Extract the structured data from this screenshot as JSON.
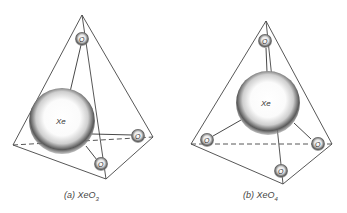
{
  "figure": {
    "panels": [
      {
        "id": "a",
        "caption_prefix": "(a) XeO",
        "caption_subscript": "3",
        "central_atom": "Xe",
        "ligand_label": "O",
        "ligand_count": 3,
        "geometry": "trigonal pyramidal in tetrahedron"
      },
      {
        "id": "b",
        "caption_prefix": "(b) XeO",
        "caption_subscript": "4",
        "central_atom": "Xe",
        "ligand_label": "O",
        "ligand_count": 4,
        "geometry": "tetrahedral"
      }
    ],
    "colors": {
      "line": "#333333",
      "shade": "#555555",
      "background": "#ffffff"
    }
  }
}
